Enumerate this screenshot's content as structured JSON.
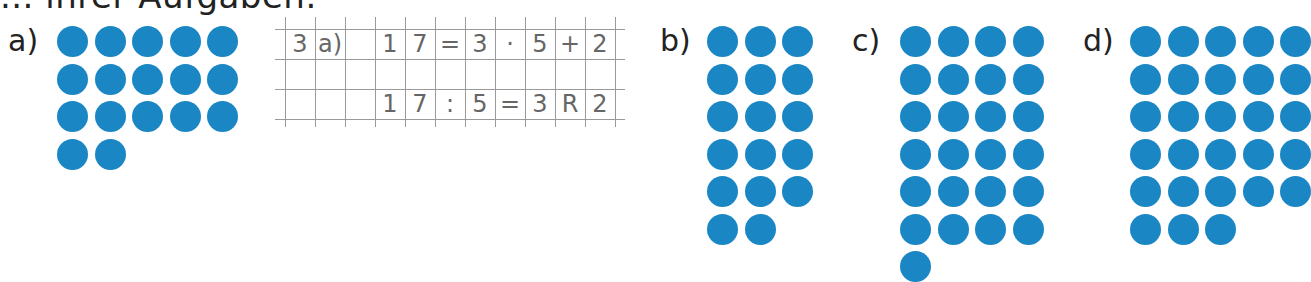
{
  "header": {
    "text": "... ihrer Aufgaben."
  },
  "groups": [
    {
      "label": "a)",
      "columns": 5,
      "count": 17,
      "rows": [
        5,
        5,
        5,
        2
      ],
      "label_pos": [
        8,
        26
      ],
      "origin": [
        57,
        26
      ]
    },
    {
      "label": "b)",
      "columns": 3,
      "count": 17,
      "rows": [
        3,
        3,
        3,
        3,
        3,
        2
      ],
      "label_pos": [
        660,
        26
      ],
      "origin": [
        707,
        26
      ]
    },
    {
      "label": "c)",
      "columns": 4,
      "count": 25,
      "rows": [
        4,
        4,
        4,
        4,
        4,
        4,
        1
      ],
      "label_pos": [
        852,
        26
      ],
      "origin": [
        900,
        26
      ]
    },
    {
      "label": "d)",
      "columns": 5,
      "count": 28,
      "rows": [
        5,
        5,
        5,
        5,
        5,
        3
      ],
      "label_pos": [
        1083,
        26
      ],
      "origin": [
        1130,
        26
      ]
    }
  ],
  "dot_color": "#1a87c4",
  "notebook_grid": {
    "rows": [
      [
        "3",
        "a)",
        "",
        "1",
        "7",
        "=",
        "3",
        "·",
        "5",
        "+",
        "2"
      ],
      [
        "",
        "",
        "",
        "",
        "",
        "",
        "",
        "",
        "",
        "",
        ""
      ],
      [
        "",
        "",
        "",
        "1",
        "7",
        ":",
        "5",
        "=",
        "3",
        "R",
        "2"
      ]
    ],
    "equation_1": "17 = 3 · 5 + 2",
    "equation_2": "17 : 5 = 3 R 2"
  }
}
